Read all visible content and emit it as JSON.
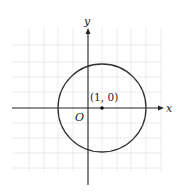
{
  "diagram": {
    "type": "coordinate-plane-circle",
    "axes": {
      "x_label": "x",
      "y_label": "y",
      "origin_label": "O"
    },
    "circle": {
      "center": [
        1,
        0
      ],
      "center_label": "(1, 0)",
      "radius_grid_units": 3
    },
    "grid": {
      "spacing_px": 14.7,
      "color": "#e6e6e6"
    },
    "colors": {
      "axis": "#222222",
      "circle": "#333333",
      "grid": "#e6e6e6"
    }
  }
}
